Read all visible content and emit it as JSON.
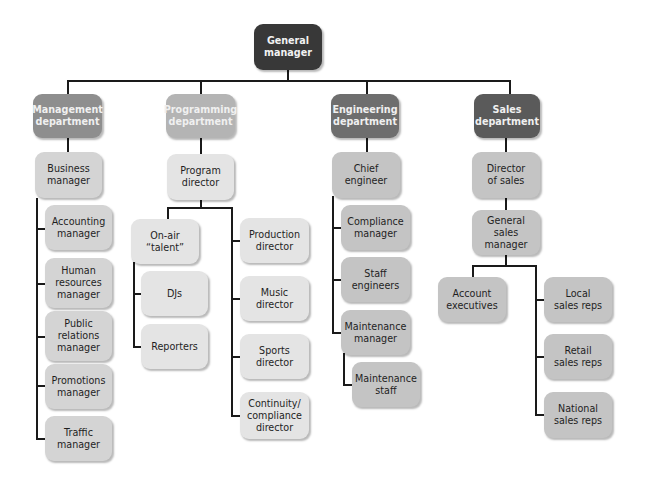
{
  "diagram": {
    "type": "org-chart",
    "root": "General manager",
    "colors": {
      "root": "#383838",
      "management_dept": "#8e8e8e",
      "programming_dept": "#b4b4b4",
      "engineering_dept": "#6e6e6e",
      "sales_dept": "#5a5a5a",
      "management_children": "#d4d4d4",
      "programming_children": "#e4e4e4",
      "engineering_children": "#c4c4c4",
      "sales_children": "#c4c4c4",
      "connector": "#1a1a1a"
    }
  },
  "nodes": {
    "general_manager": "General\nmanager",
    "management_department": "Management\ndepartment",
    "programming_department": "Programming\ndepartment",
    "engineering_department": "Engineering\ndepartment",
    "sales_department": "Sales\ndepartment",
    "business_manager": "Business\nmanager",
    "accounting_manager": "Accounting\nmanager",
    "human_resources_manager": "Human\nresources\nmanager",
    "public_relations_manager": "Public\nrelations\nmanager",
    "promotions_manager": "Promotions\nmanager",
    "traffic_manager": "Traffic\nmanager",
    "program_director": "Program\ndirector",
    "on_air_talent": "On-air\n“talent”",
    "djs": "DJs",
    "reporters": "Reporters",
    "production_director": "Production\ndirector",
    "music_director": "Music\ndirector",
    "sports_director": "Sports\ndirector",
    "continuity_compliance_director": "Continuity/\ncompliance\ndirector",
    "chief_engineer": "Chief\nengineer",
    "compliance_manager": "Compliance\nmanager",
    "staff_engineers": "Staff\nengineers",
    "maintenance_manager": "Maintenance\nmanager",
    "maintenance_staff": "Maintenance\nstaff",
    "director_of_sales": "Director\nof sales",
    "general_sales_manager": "General\nsales\nmanager",
    "account_executives": "Account\nexecutives",
    "local_sales_reps": "Local\nsales reps",
    "retail_sales_reps": "Retail\nsales reps",
    "national_sales_reps": "National\nsales reps"
  }
}
